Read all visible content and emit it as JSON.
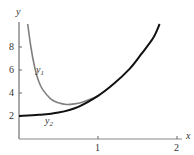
{
  "chart_data": {
    "type": "line",
    "title": "",
    "xlabel": "x",
    "ylabel": "y",
    "xlim": [
      0,
      2.2
    ],
    "ylim": [
      0,
      10.5
    ],
    "x_ticks": [
      "1",
      "2"
    ],
    "y_ticks": [
      "2",
      "4",
      "6",
      "8"
    ],
    "grid": false,
    "legend": "inline curve labels",
    "series": [
      {
        "name": "y1",
        "label_main": "y",
        "label_sub": "1",
        "color": "#808080",
        "points": [
          [
            0.11,
            10.0
          ],
          [
            0.15,
            8.0
          ],
          [
            0.2,
            6.2
          ],
          [
            0.25,
            5.0
          ],
          [
            0.3,
            4.3
          ],
          [
            0.4,
            3.5
          ],
          [
            0.5,
            3.15
          ],
          [
            0.6,
            3.0
          ],
          [
            0.7,
            3.05
          ],
          [
            0.8,
            3.2
          ],
          [
            0.9,
            3.45
          ],
          [
            1.0,
            3.75
          ]
        ]
      },
      {
        "name": "y2",
        "label_main": "y",
        "label_sub": "2",
        "color": "#111111",
        "points": [
          [
            0.0,
            2.0
          ],
          [
            0.25,
            2.1
          ],
          [
            0.5,
            2.3
          ],
          [
            0.75,
            2.8
          ],
          [
            1.0,
            3.75
          ],
          [
            1.2,
            4.8
          ],
          [
            1.4,
            6.1
          ],
          [
            1.55,
            7.4
          ],
          [
            1.7,
            8.8
          ],
          [
            1.78,
            10.0
          ]
        ]
      }
    ]
  }
}
